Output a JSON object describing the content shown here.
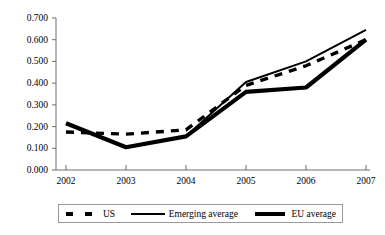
{
  "chart_data": {
    "type": "line",
    "title": "",
    "subtitle": "",
    "xlabel": "",
    "ylabel": "",
    "x": [
      "2002",
      "2003",
      "2004",
      "2005",
      "2006",
      "2007"
    ],
    "categories": [
      "2002",
      "2003",
      "2004",
      "2005",
      "2006",
      "2007"
    ],
    "xlim": [
      "2002",
      "2007"
    ],
    "ylim": [
      0.0,
      0.7
    ],
    "ytick_labels": [
      "0.700",
      "0.600",
      "0.500",
      "0.400",
      "0.300",
      "0.200",
      "0.100",
      "0.000"
    ],
    "ytick_values": [
      0.7,
      0.6,
      0.5,
      0.4,
      0.3,
      0.2,
      0.1,
      0.0
    ],
    "ytick_step": 0.1,
    "xtick_labels": [
      "2002",
      "2003",
      "2004",
      "2005",
      "2006",
      "2007"
    ],
    "grid": false,
    "legend_position": "bottom",
    "series": [
      {
        "name": "US",
        "style": "dashed",
        "color": "#000000",
        "values": [
          0.175,
          0.165,
          0.185,
          0.39,
          0.48,
          0.6
        ]
      },
      {
        "name": "Emerging average",
        "style": "solid-thin",
        "color": "#000000",
        "values": [
          0.215,
          0.105,
          0.155,
          0.405,
          0.5,
          0.645
        ]
      },
      {
        "name": "EU average",
        "style": "solid-thick",
        "color": "#000000",
        "values": [
          0.215,
          0.105,
          0.155,
          0.36,
          0.38,
          0.6
        ]
      }
    ],
    "annotations": []
  },
  "axes": {
    "y_labels": [
      {
        "text": "0.700"
      },
      {
        "text": "0.600"
      },
      {
        "text": "0.500"
      },
      {
        "text": "0.400"
      },
      {
        "text": "0.300"
      },
      {
        "text": "0.200"
      },
      {
        "text": "0.100"
      },
      {
        "text": "0.000"
      }
    ],
    "x_labels": [
      {
        "text": "2002"
      },
      {
        "text": "2003"
      },
      {
        "text": "2004"
      },
      {
        "text": "2005"
      },
      {
        "text": "2006"
      },
      {
        "text": "2007"
      }
    ]
  },
  "legend": {
    "entries": [
      {
        "label": "US",
        "marker": "dashed-line-marker"
      },
      {
        "label": "Emerging average",
        "marker": "thin-solid-line-marker"
      },
      {
        "label": "EU average",
        "marker": "thick-solid-line-marker"
      }
    ]
  },
  "colors": {
    "ink": "#000000",
    "axis": "#6f6f6f",
    "legend_border": "#9a9a9a",
    "background": "#ffffff"
  }
}
